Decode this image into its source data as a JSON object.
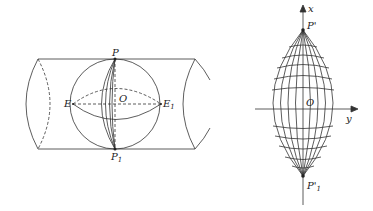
{
  "left_figure": {
    "labels": {
      "P": "P",
      "P1": "P",
      "P1_sub": "1",
      "E": "E",
      "E1": "E",
      "E1_sub": "1",
      "O": "O"
    }
  },
  "right_figure": {
    "labels": {
      "x_axis": "x",
      "y_axis": "y",
      "P_prime": "P'",
      "P1_prime": "P'",
      "P1_prime_sub": "1",
      "O": "O"
    }
  },
  "colors": {
    "stroke": "#333333",
    "background": "#ffffff"
  }
}
